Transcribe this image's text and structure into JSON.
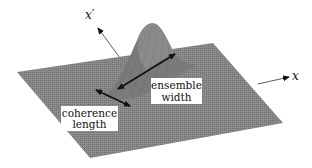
{
  "figure": {
    "axes": {
      "x_label": "x",
      "x_prime_label": "x′"
    },
    "annotations": {
      "ensemble_width": [
        "ensemble",
        "width"
      ],
      "coherence_length": [
        "coherence",
        "length"
      ]
    },
    "colors": {
      "surface": "#8a8a8a",
      "surface_dark": "#5c5c5c",
      "arrow": "#111111",
      "label_box": "#ffffff"
    }
  }
}
